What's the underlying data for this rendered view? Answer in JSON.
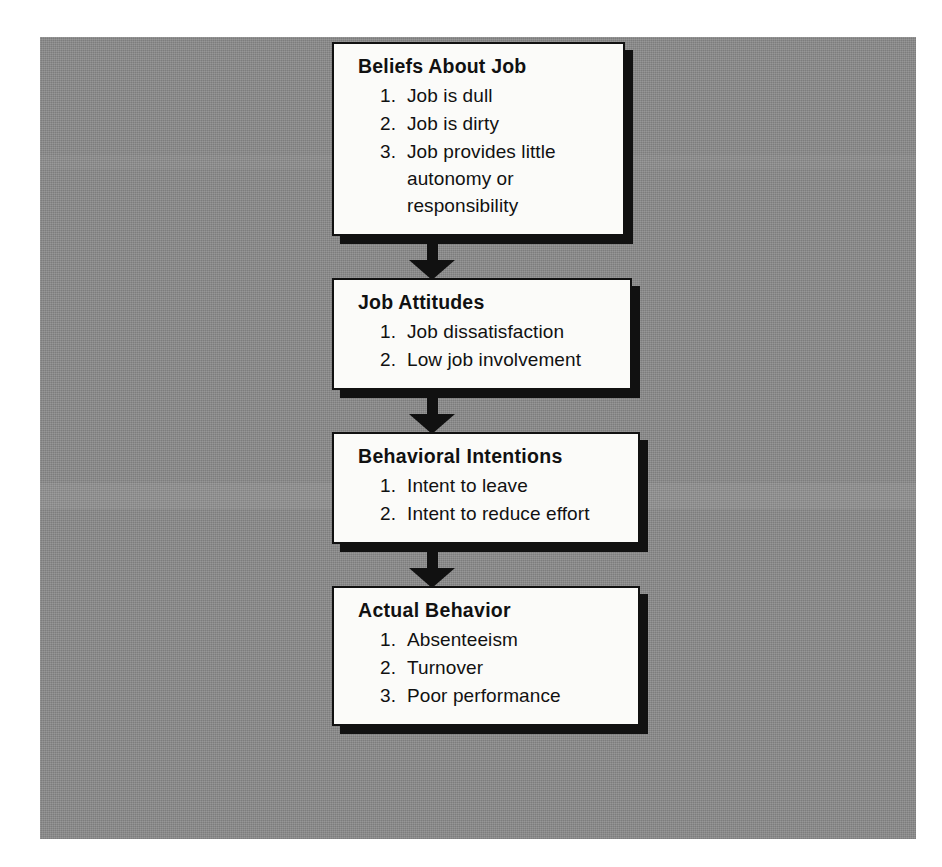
{
  "diagram": {
    "background_color": "#8b8b8b",
    "box_fill_color": "#fbfbf9",
    "ink_color": "#111111",
    "flow_direction": "top-to-bottom",
    "boxes": [
      {
        "id": "beliefs-about-job",
        "title": "Beliefs About Job",
        "items": [
          {
            "num": "1.",
            "text": "Job is dull"
          },
          {
            "num": "2.",
            "text": "Job is dirty"
          },
          {
            "num": "3.",
            "text": "Job provides little autonomy or responsibility"
          }
        ]
      },
      {
        "id": "job-attitudes",
        "title": "Job Attitudes",
        "items": [
          {
            "num": "1.",
            "text": "Job dissatisfaction"
          },
          {
            "num": "2.",
            "text": "Low job involvement"
          }
        ]
      },
      {
        "id": "behavioral-intentions",
        "title": "Behavioral Intentions",
        "items": [
          {
            "num": "1.",
            "text": "Intent to leave"
          },
          {
            "num": "2.",
            "text": "Intent to reduce effort"
          }
        ]
      },
      {
        "id": "actual-behavior",
        "title": "Actual Behavior",
        "items": [
          {
            "num": "1.",
            "text": "Absenteeism"
          },
          {
            "num": "2.",
            "text": "Turnover"
          },
          {
            "num": "3.",
            "text": "Poor performance"
          }
        ]
      }
    ],
    "connectors": [
      {
        "id": "arrow-1",
        "from": "beliefs-about-job",
        "to": "job-attitudes",
        "glyph": "down-arrow"
      },
      {
        "id": "arrow-2",
        "from": "job-attitudes",
        "to": "behavioral-intentions",
        "glyph": "down-arrow"
      },
      {
        "id": "arrow-3",
        "from": "behavioral-intentions",
        "to": "actual-behavior",
        "glyph": "down-arrow"
      }
    ]
  }
}
